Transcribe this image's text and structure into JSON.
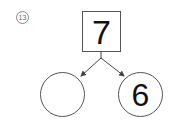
{
  "problem": {
    "number_label": "13",
    "whole": "7",
    "parts": [
      "",
      "6"
    ]
  }
}
